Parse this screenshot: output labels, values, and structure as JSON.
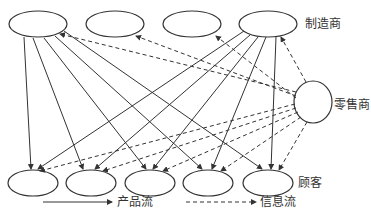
{
  "diagram": {
    "labels": {
      "manufacturer": "制造商",
      "retailer": "零售商",
      "customer": "顾客"
    },
    "legend": {
      "product_flow": "产品流",
      "info_flow": "信息流"
    },
    "nodes": {
      "manufacturers": [
        {
          "id": "m1",
          "cx": 38,
          "cy": 24
        },
        {
          "id": "m2",
          "cx": 115,
          "cy": 24
        },
        {
          "id": "m3",
          "cx": 192,
          "cy": 24
        },
        {
          "id": "m4",
          "cx": 268,
          "cy": 24
        }
      ],
      "retailer": {
        "id": "r",
        "cx": 313,
        "cy": 102,
        "r": 20
      },
      "customers": [
        {
          "id": "c1",
          "cx": 33,
          "cy": 183
        },
        {
          "id": "c2",
          "cx": 91,
          "cy": 183
        },
        {
          "id": "c3",
          "cx": 150,
          "cy": 183
        },
        {
          "id": "c4",
          "cx": 208,
          "cy": 183
        },
        {
          "id": "c5",
          "cx": 268,
          "cy": 183
        }
      ]
    },
    "edges": {
      "product_flow": "manufacturer 1 and manufacturer 4 each to all five customers (solid arrows)",
      "info_flow": "retailer to all manufacturers and all customers (dashed arrows)"
    },
    "colors": {
      "stroke": "#333333",
      "background": "#ffffff"
    }
  }
}
